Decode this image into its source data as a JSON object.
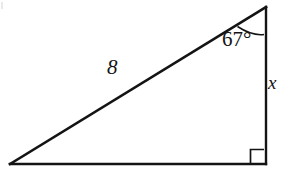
{
  "figure": {
    "kind": "right-triangle-diagram",
    "background_color": "#ffffff",
    "stroke_color": "#141414",
    "canvas": {
      "width": 284,
      "height": 173
    },
    "vertices": {
      "left": {
        "x": 10,
        "y": 164
      },
      "bottom_right": {
        "x": 266,
        "y": 164
      },
      "top_right": {
        "x": 266,
        "y": 7
      }
    },
    "labels": {
      "hypotenuse": "8",
      "vertical_side": "x",
      "angle": "67°"
    },
    "markers": {
      "right_angle_square": "right-angle-marker",
      "angle_arc": "angle-arc-67"
    }
  }
}
